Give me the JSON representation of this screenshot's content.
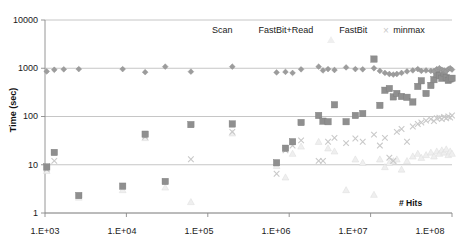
{
  "chart_data": {
    "type": "scatter",
    "title": "",
    "xlabel": "# Hits",
    "ylabel": "Time (sec)",
    "xscale": "log",
    "yscale": "log",
    "xlim": [
      1000,
      100000000
    ],
    "ylim": [
      1,
      10000
    ],
    "grid": true,
    "legend_position": "top-center",
    "xticks": [
      "1.E+03",
      "1.E+04",
      "1.E+05",
      "1.E+06",
      "1.E+07",
      "1.E+08"
    ],
    "xtick_values": [
      1000,
      10000,
      100000,
      1000000,
      10000000,
      100000000
    ],
    "yticks": [
      "1",
      "10",
      "100",
      "1000",
      "10000"
    ],
    "ytick_values": [
      1,
      10,
      100,
      1000,
      10000
    ],
    "series": [
      {
        "name": "Scan",
        "marker": "diamond",
        "color": "#9c9c9c",
        "points": [
          [
            1050,
            860
          ],
          [
            1300,
            930
          ],
          [
            1700,
            950
          ],
          [
            2600,
            960
          ],
          [
            9000,
            960
          ],
          [
            17000,
            830
          ],
          [
            30000,
            1080
          ],
          [
            62000,
            850
          ],
          [
            200000,
            1080
          ],
          [
            700000,
            820
          ],
          [
            900000,
            840
          ],
          [
            1100000,
            800
          ],
          [
            1400000,
            950
          ],
          [
            2300000,
            1080
          ],
          [
            2600000,
            900
          ],
          [
            3000000,
            960
          ],
          [
            3600000,
            920
          ],
          [
            5000000,
            1040
          ],
          [
            6500000,
            960
          ],
          [
            8000000,
            950
          ],
          [
            11000000,
            1000
          ],
          [
            13000000,
            880
          ],
          [
            15000000,
            800
          ],
          [
            17000000,
            760
          ],
          [
            19000000,
            740
          ],
          [
            21000000,
            760
          ],
          [
            24000000,
            800
          ],
          [
            28000000,
            860
          ],
          [
            33000000,
            900
          ],
          [
            38000000,
            960
          ],
          [
            42000000,
            880
          ],
          [
            48000000,
            900
          ],
          [
            55000000,
            880
          ],
          [
            60000000,
            870
          ],
          [
            65000000,
            960
          ],
          [
            70000000,
            1000
          ],
          [
            75000000,
            930
          ],
          [
            80000000,
            900
          ],
          [
            85000000,
            870
          ],
          [
            90000000,
            960
          ],
          [
            95000000,
            1000
          ],
          [
            100000000,
            940
          ]
        ]
      },
      {
        "name": "FastBit+Read",
        "marker": "square",
        "color": "#8f8f8f",
        "points": [
          [
            1050,
            9.0
          ],
          [
            1300,
            18.0
          ],
          [
            2600,
            2.3
          ],
          [
            9000,
            3.6
          ],
          [
            17000,
            43.0
          ],
          [
            30000,
            4.5
          ],
          [
            62000,
            68.0
          ],
          [
            200000,
            70.0
          ],
          [
            700000,
            11.0
          ],
          [
            900000,
            22.0
          ],
          [
            1100000,
            30.0
          ],
          [
            1400000,
            75.0
          ],
          [
            2300000,
            105.0
          ],
          [
            2600000,
            80.0
          ],
          [
            3000000,
            78.0
          ],
          [
            3600000,
            175.0
          ],
          [
            5000000,
            78.0
          ],
          [
            6500000,
            105.0
          ],
          [
            8000000,
            115.0
          ],
          [
            11000000,
            1550.0
          ],
          [
            13000000,
            170.0
          ],
          [
            15000000,
            350.0
          ],
          [
            17000000,
            380.0
          ],
          [
            19000000,
            255.0
          ],
          [
            21000000,
            300.0
          ],
          [
            24000000,
            260.0
          ],
          [
            28000000,
            250.0
          ],
          [
            33000000,
            200.0
          ],
          [
            38000000,
            420.0
          ],
          [
            42000000,
            550.0
          ],
          [
            48000000,
            300.0
          ],
          [
            55000000,
            440.0
          ],
          [
            60000000,
            580.0
          ],
          [
            65000000,
            760.0
          ],
          [
            70000000,
            700.0
          ],
          [
            75000000,
            620.0
          ],
          [
            80000000,
            800.0
          ],
          [
            85000000,
            640.0
          ],
          [
            90000000,
            560.0
          ],
          [
            95000000,
            600.0
          ],
          [
            100000000,
            620.0
          ]
        ]
      },
      {
        "name": "FastBit",
        "marker": "triangle",
        "color": "#efefef",
        "points": [
          [
            1050,
            7.5
          ],
          [
            2600,
            2.1
          ],
          [
            9000,
            3.0
          ],
          [
            17000,
            36.0
          ],
          [
            30000,
            3.4
          ],
          [
            62000,
            1.7
          ],
          [
            200000,
            45.0
          ],
          [
            700000,
            9.5
          ],
          [
            900000,
            5.5
          ],
          [
            1100000,
            17.0
          ],
          [
            1400000,
            24.0
          ],
          [
            2300000,
            30.0
          ],
          [
            3000000,
            22.0
          ],
          [
            3600000,
            19.0
          ],
          [
            5000000,
            3.0
          ],
          [
            6500000,
            13.0
          ],
          [
            8000000,
            11.0
          ],
          [
            11000000,
            2.4
          ],
          [
            13000000,
            13.0
          ],
          [
            15000000,
            9.0
          ],
          [
            17000000,
            11.0
          ],
          [
            19000000,
            12.0
          ],
          [
            21000000,
            13.0
          ],
          [
            24000000,
            8.0
          ],
          [
            28000000,
            12.0
          ],
          [
            33000000,
            15.0
          ],
          [
            38000000,
            17.0
          ],
          [
            42000000,
            14.0
          ],
          [
            48000000,
            16.0
          ],
          [
            55000000,
            18.0
          ],
          [
            60000000,
            15.0
          ],
          [
            65000000,
            19.0
          ],
          [
            70000000,
            17.0
          ],
          [
            75000000,
            20.0
          ],
          [
            80000000,
            18.0
          ],
          [
            85000000,
            21.0
          ],
          [
            90000000,
            16.0
          ],
          [
            95000000,
            19.0
          ],
          [
            100000000,
            17.0
          ]
        ]
      },
      {
        "name": "minmax",
        "marker": "x",
        "color": "#c9c9c9",
        "points": [
          [
            1050,
            8.0
          ],
          [
            1300,
            12.0
          ],
          [
            17000,
            38.0
          ],
          [
            62000,
            13.0
          ],
          [
            200000,
            48.0
          ],
          [
            700000,
            6.5
          ],
          [
            900000,
            20.0
          ],
          [
            1100000,
            25.0
          ],
          [
            1400000,
            32.0
          ],
          [
            2300000,
            12.0
          ],
          [
            2600000,
            12.0
          ],
          [
            3000000,
            30.0
          ],
          [
            3600000,
            36.0
          ],
          [
            5000000,
            28.0
          ],
          [
            6500000,
            35.0
          ],
          [
            8000000,
            30.0
          ],
          [
            11000000,
            42.0
          ],
          [
            13000000,
            25.0
          ],
          [
            15000000,
            36.0
          ],
          [
            17000000,
            14.0
          ],
          [
            19000000,
            12.0
          ],
          [
            21000000,
            48.0
          ],
          [
            24000000,
            55.0
          ],
          [
            28000000,
            30.0
          ],
          [
            33000000,
            62.0
          ],
          [
            38000000,
            70.0
          ],
          [
            42000000,
            75.0
          ],
          [
            48000000,
            82.0
          ],
          [
            55000000,
            88.0
          ],
          [
            60000000,
            80.0
          ],
          [
            65000000,
            92.0
          ],
          [
            70000000,
            95.0
          ],
          [
            75000000,
            88.0
          ],
          [
            80000000,
            98.0
          ],
          [
            85000000,
            92.0
          ],
          [
            90000000,
            100.0
          ],
          [
            95000000,
            95.0
          ],
          [
            100000000,
            105.0
          ]
        ]
      }
    ]
  },
  "axes": {
    "y_title": "Time (sec)",
    "x_title": "# Hits",
    "y_labels": [
      "10000",
      "1000",
      "100",
      "10",
      "1"
    ],
    "x_labels": [
      "1.E+03",
      "1.E+04",
      "1.E+05",
      "1.E+06",
      "1.E+07",
      "1.E+08"
    ]
  },
  "legend": {
    "items": [
      {
        "label": "Scan",
        "marker": "diamond-icon",
        "color": "#9c9c9c"
      },
      {
        "label": "FastBit+Read",
        "marker": "square-icon",
        "color": "#8f8f8f"
      },
      {
        "label": "FastBit",
        "marker": "triangle-icon",
        "color": "#efefef"
      },
      {
        "label": "minmax",
        "marker": "x-icon",
        "color": "#c9c9c9"
      }
    ]
  }
}
